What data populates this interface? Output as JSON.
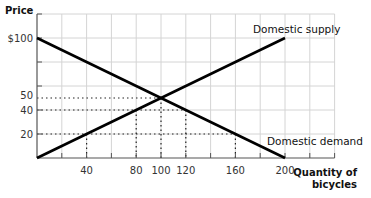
{
  "chart_data": {
    "type": "line",
    "title": "",
    "xlabel": "Quantity of bicycles",
    "xlabel_lines": [
      "Quantity of",
      "bicycles"
    ],
    "ylabel": "Price",
    "xlim": [
      0,
      240
    ],
    "ylim": [
      0,
      120
    ],
    "grid": true,
    "x_ticks": [
      {
        "value": 40,
        "label": "40"
      },
      {
        "value": 80,
        "label": "80"
      },
      {
        "value": 100,
        "label": "100"
      },
      {
        "value": 120,
        "label": "120"
      },
      {
        "value": 160,
        "label": "160"
      },
      {
        "value": 200,
        "label": "200"
      }
    ],
    "y_ticks": [
      {
        "value": 100,
        "label": "$100"
      },
      {
        "value": 50,
        "label": "50"
      },
      {
        "value": 40,
        "label": "40"
      },
      {
        "value": 20,
        "label": "20"
      }
    ],
    "series": [
      {
        "name": "Domestic supply",
        "points": [
          [
            0,
            0
          ],
          [
            200,
            100
          ]
        ]
      },
      {
        "name": "Domestic demand",
        "points": [
          [
            0,
            100
          ],
          [
            200,
            0
          ]
        ]
      }
    ],
    "reference_lines": [
      {
        "price": 50,
        "from_q": 0,
        "to_q": 100,
        "drop_q": 100
      },
      {
        "price": 40,
        "from_q": 0,
        "to_q": 120,
        "drop_q": [
          80,
          120
        ]
      },
      {
        "price": 20,
        "from_q": 0,
        "to_q": 160,
        "drop_q": [
          40,
          160
        ]
      }
    ],
    "annotations": [
      {
        "text": "Domestic supply",
        "near": [
          200,
          100
        ]
      },
      {
        "text": "Domestic demand",
        "near": [
          200,
          0
        ]
      }
    ],
    "equilibrium": {
      "quantity": 100,
      "price": 50
    }
  }
}
